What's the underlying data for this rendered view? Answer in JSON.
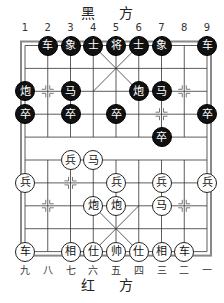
{
  "header": {
    "black_side": "黑 方"
  },
  "footer": {
    "red_side": "红 方"
  },
  "top_labels": [
    "1",
    "2",
    "3",
    "4",
    "5",
    "6",
    "7",
    "8",
    "9"
  ],
  "bottom_labels": [
    "九",
    "八",
    "七",
    "六",
    "五",
    "四",
    "三",
    "二",
    "一"
  ],
  "colors": {
    "black_piece": "#111111",
    "red_piece_bg": "#ffffff",
    "line": "#333333",
    "frame": "#888888"
  },
  "pieces": [
    {
      "side": "black",
      "char": "车",
      "col": 2,
      "row": 0
    },
    {
      "side": "black",
      "char": "象",
      "col": 3,
      "row": 0
    },
    {
      "side": "black",
      "char": "士",
      "col": 4,
      "row": 0
    },
    {
      "side": "black",
      "char": "将",
      "col": 5,
      "row": 0
    },
    {
      "side": "black",
      "char": "士",
      "col": 6,
      "row": 0
    },
    {
      "side": "black",
      "char": "象",
      "col": 7,
      "row": 0
    },
    {
      "side": "black",
      "char": "车",
      "col": 9,
      "row": 0
    },
    {
      "side": "black",
      "char": "炮",
      "col": 1,
      "row": 2
    },
    {
      "side": "black",
      "char": "马",
      "col": 3,
      "row": 2
    },
    {
      "side": "black",
      "char": "炮",
      "col": 6,
      "row": 2
    },
    {
      "side": "black",
      "char": "马",
      "col": 7,
      "row": 2
    },
    {
      "side": "black",
      "char": "卒",
      "col": 1,
      "row": 3
    },
    {
      "side": "black",
      "char": "卒",
      "col": 3,
      "row": 3
    },
    {
      "side": "black",
      "char": "卒",
      "col": 5,
      "row": 3
    },
    {
      "side": "black",
      "char": "卒",
      "col": 9,
      "row": 3
    },
    {
      "side": "black",
      "char": "卒",
      "col": 7,
      "row": 4
    },
    {
      "side": "red",
      "char": "兵",
      "col": 3,
      "row": 5
    },
    {
      "side": "red",
      "char": "马",
      "col": 4,
      "row": 5
    },
    {
      "side": "red",
      "char": "兵",
      "col": 1,
      "row": 6
    },
    {
      "side": "red",
      "char": "兵",
      "col": 5,
      "row": 6
    },
    {
      "side": "red",
      "char": "兵",
      "col": 7,
      "row": 6
    },
    {
      "side": "red",
      "char": "兵",
      "col": 9,
      "row": 6
    },
    {
      "side": "red",
      "char": "炮",
      "col": 4,
      "row": 7
    },
    {
      "side": "red",
      "char": "炮",
      "col": 5,
      "row": 7
    },
    {
      "side": "red",
      "char": "马",
      "col": 7,
      "row": 7
    },
    {
      "side": "red",
      "char": "车",
      "col": 1,
      "row": 9
    },
    {
      "side": "red",
      "char": "相",
      "col": 3,
      "row": 9
    },
    {
      "side": "red",
      "char": "仕",
      "col": 4,
      "row": 9
    },
    {
      "side": "red",
      "char": "帅",
      "col": 5,
      "row": 9
    },
    {
      "side": "red",
      "char": "仕",
      "col": 6,
      "row": 9
    },
    {
      "side": "red",
      "char": "相",
      "col": 7,
      "row": 9
    },
    {
      "side": "red",
      "char": "车",
      "col": 8,
      "row": 9
    }
  ],
  "position_marks": [
    {
      "col": 2,
      "row": 2
    },
    {
      "col": 8,
      "row": 2
    },
    {
      "col": 7,
      "row": 3
    },
    {
      "col": 3,
      "row": 6
    },
    {
      "col": 2,
      "row": 7
    },
    {
      "col": 8,
      "row": 7
    }
  ]
}
